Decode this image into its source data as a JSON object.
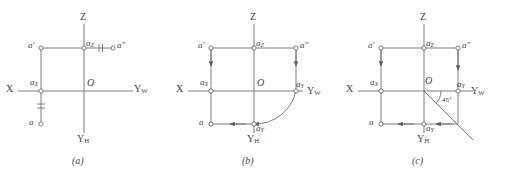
{
  "figure": {
    "background": "#ffffff",
    "stroke_color": "#6e6e6e",
    "text_color": "#3f3f3f",
    "panels": [
      {
        "id": "a",
        "caption": "(a)",
        "axes": {
          "x_label": "X",
          "z_label": "Z",
          "yw_label_main": "Y",
          "yw_label_sub": "W",
          "yh_label_main": "Y",
          "yh_label_sub": "H"
        },
        "points": [
          {
            "name": "a-prime",
            "label_main": "a",
            "label_sup": "′",
            "label_sub": ""
          },
          {
            "name": "a-double-prime",
            "label_main": "a",
            "label_sup": "″",
            "label_sub": ""
          },
          {
            "name": "a-sub-z",
            "label_main": "a",
            "label_sup": "",
            "label_sub": "Z"
          },
          {
            "name": "a-sub-x",
            "label_main": "a",
            "label_sup": "",
            "label_sub": "X"
          },
          {
            "name": "a-plain",
            "label_main": "a",
            "label_sup": "",
            "label_sub": ""
          },
          {
            "name": "origin",
            "label_main": "O",
            "label_sup": "",
            "label_sub": ""
          }
        ],
        "tick_marks": [
          "equal-mark-horizontal",
          "equal-mark-vertical"
        ],
        "arrows": []
      },
      {
        "id": "b",
        "caption": "(b)",
        "axes": {
          "x_label": "X",
          "z_label": "Z",
          "yw_label_main": "Y",
          "yw_label_sub": "W",
          "yh_label_main": "Y",
          "yh_label_sub": "H"
        },
        "points": [
          {
            "name": "a-prime",
            "label_main": "a",
            "label_sup": "′",
            "label_sub": ""
          },
          {
            "name": "a-double-prime",
            "label_main": "a",
            "label_sup": "″",
            "label_sub": ""
          },
          {
            "name": "a-sub-z",
            "label_main": "a",
            "label_sup": "",
            "label_sub": "Z"
          },
          {
            "name": "a-sub-x",
            "label_main": "a",
            "label_sup": "",
            "label_sub": "X"
          },
          {
            "name": "a-sub-y-w",
            "label_main": "a",
            "label_sup": "",
            "label_sub": "Y"
          },
          {
            "name": "a-sub-y-h",
            "label_main": "a",
            "label_sup": "",
            "label_sub": "Y"
          },
          {
            "name": "a-plain",
            "label_main": "a",
            "label_sup": "",
            "label_sub": ""
          },
          {
            "name": "origin",
            "label_main": "O",
            "label_sup": "",
            "label_sub": ""
          }
        ],
        "tick_marks": [],
        "arrows": [
          "down-left",
          "down-right",
          "left-bottom",
          "arc-yw-to-yh"
        ]
      },
      {
        "id": "c",
        "caption": "(c)",
        "axes": {
          "x_label": "X",
          "z_label": "Z",
          "yw_label_main": "Y",
          "yw_label_sub": "W",
          "yh_label_main": "Y",
          "yh_label_sub": "H"
        },
        "points": [
          {
            "name": "a-prime",
            "label_main": "a",
            "label_sup": "′",
            "label_sub": ""
          },
          {
            "name": "a-double-prime",
            "label_main": "a",
            "label_sup": "″",
            "label_sub": ""
          },
          {
            "name": "a-sub-z",
            "label_main": "a",
            "label_sup": "",
            "label_sub": "Z"
          },
          {
            "name": "a-sub-x",
            "label_main": "a",
            "label_sup": "",
            "label_sub": "X"
          },
          {
            "name": "a-sub-y-w",
            "label_main": "a",
            "label_sup": "",
            "label_sub": "Y"
          },
          {
            "name": "a-sub-y-h",
            "label_main": "a",
            "label_sup": "",
            "label_sub": "Y"
          },
          {
            "name": "a-plain",
            "label_main": "a",
            "label_sup": "",
            "label_sub": ""
          },
          {
            "name": "origin",
            "label_main": "O",
            "label_sup": "",
            "label_sub": ""
          }
        ],
        "angle_label": "45°",
        "tick_marks": [],
        "arrows": [
          "down-left",
          "down-right",
          "left-bottom-1",
          "left-bottom-2",
          "bisector-45"
        ]
      }
    ]
  }
}
